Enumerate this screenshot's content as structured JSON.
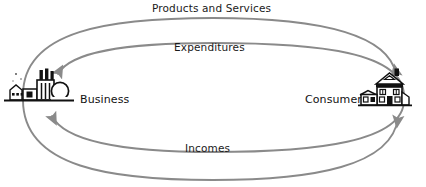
{
  "diagram": {
    "type": "circular-flow",
    "background_color": "#ffffff",
    "arc_color": "#8a8a8a",
    "text_color": "#1a1a1a",
    "icon_color": "#111111"
  },
  "nodes": [
    {
      "id": "business",
      "label": "Business",
      "icon": "factory-icon",
      "side": "left"
    },
    {
      "id": "consumers",
      "label": "Consumers",
      "icon": "house-icon",
      "side": "right"
    }
  ],
  "flows": [
    {
      "id": "products-and-services",
      "label": "Products and Services",
      "from": "business",
      "to": "consumers",
      "position": "top-outer",
      "arrow_end": "right"
    },
    {
      "id": "expenditures",
      "label": "Expenditures",
      "from": "consumers",
      "to": "business",
      "position": "top-inner",
      "arrow_end": "left"
    },
    {
      "id": "incomes",
      "label": "Incomes",
      "from": "business",
      "to": "consumers",
      "position": "bottom-outer",
      "arrow_end": "right"
    },
    {
      "id": "resources-flow",
      "label": "",
      "from": "consumers",
      "to": "business",
      "position": "bottom-inner",
      "arrow_end": "left"
    }
  ],
  "labels": {
    "products_and_services": "Products and Services",
    "expenditures": "Expenditures",
    "incomes": "Incomes",
    "business": "Business",
    "consumers": "Consumers"
  }
}
